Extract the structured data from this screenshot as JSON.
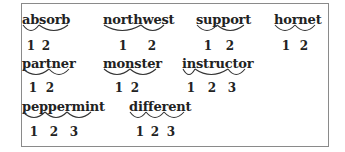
{
  "exercise": {
    "words": [
      {
        "word": "absorb",
        "syllables": [
          "ab",
          "sorb"
        ],
        "numbers": [
          "1",
          "2"
        ]
      },
      {
        "word": "northwest",
        "syllables": [
          "north",
          "west"
        ],
        "numbers": [
          "1",
          "2"
        ]
      },
      {
        "word": "support",
        "syllables": [
          "sup",
          "port"
        ],
        "numbers": [
          "1",
          "2"
        ]
      },
      {
        "word": "hornet",
        "syllables": [
          "hor",
          "net"
        ],
        "numbers": [
          "1",
          "2"
        ]
      },
      {
        "word": "partner",
        "syllables": [
          "part",
          "ner"
        ],
        "numbers": [
          "1",
          "2"
        ]
      },
      {
        "word": "monster",
        "syllables": [
          "mon",
          "ster"
        ],
        "numbers": [
          "1",
          "2"
        ]
      },
      {
        "word": "instructor",
        "syllables": [
          "in",
          "struc",
          "tor"
        ],
        "numbers": [
          "1",
          "2",
          "3"
        ]
      },
      {
        "word": "peppermint",
        "syllables": [
          "pep",
          "per",
          "mint"
        ],
        "numbers": [
          "1",
          "2",
          "3"
        ]
      },
      {
        "word": "different",
        "syllables": [
          "dif",
          "fer",
          "ent"
        ],
        "numbers": [
          "1",
          "2",
          "3"
        ]
      }
    ]
  }
}
